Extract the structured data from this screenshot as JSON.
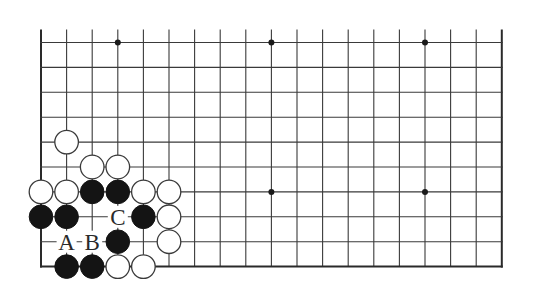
{
  "diagram": {
    "type": "go-board-partial",
    "colors": {
      "background": "#ffffff",
      "line": "#3a3a3a",
      "black_stone": "#141414",
      "white_stone": "#ffffff"
    },
    "grid": {
      "columns": 19,
      "rows": 10,
      "origin_x": 41,
      "origin_y": 42.5,
      "col_spacing": 25.6,
      "row_spacing": 24.9,
      "top_extension": 13,
      "edges": [
        "left",
        "right",
        "bottom"
      ]
    },
    "star_points": [
      {
        "col": 3,
        "row": 0
      },
      {
        "col": 9,
        "row": 0
      },
      {
        "col": 15,
        "row": 0
      },
      {
        "col": 9,
        "row": 6
      },
      {
        "col": 15,
        "row": 6
      }
    ],
    "stones": [
      {
        "color": "white",
        "col": 1,
        "row": 4
      },
      {
        "color": "white",
        "col": 2,
        "row": 5
      },
      {
        "color": "white",
        "col": 3,
        "row": 5
      },
      {
        "color": "white",
        "col": 0,
        "row": 6
      },
      {
        "color": "white",
        "col": 1,
        "row": 6
      },
      {
        "color": "black",
        "col": 2,
        "row": 6
      },
      {
        "color": "black",
        "col": 3,
        "row": 6
      },
      {
        "color": "white",
        "col": 4,
        "row": 6
      },
      {
        "color": "white",
        "col": 5,
        "row": 6
      },
      {
        "color": "black",
        "col": 0,
        "row": 7
      },
      {
        "color": "black",
        "col": 1,
        "row": 7
      },
      {
        "color": "black",
        "col": 4,
        "row": 7
      },
      {
        "color": "white",
        "col": 5,
        "row": 7
      },
      {
        "color": "black",
        "col": 3,
        "row": 8
      },
      {
        "color": "white",
        "col": 5,
        "row": 8
      },
      {
        "color": "black",
        "col": 1,
        "row": 9
      },
      {
        "color": "black",
        "col": 2,
        "row": 9
      },
      {
        "color": "white",
        "col": 3,
        "row": 9
      },
      {
        "color": "white",
        "col": 4,
        "row": 9
      }
    ],
    "labels": [
      {
        "text": "A",
        "col": 1,
        "row": 8
      },
      {
        "text": "B",
        "col": 2,
        "row": 8
      },
      {
        "text": "C",
        "col": 3,
        "row": 7
      }
    ]
  }
}
